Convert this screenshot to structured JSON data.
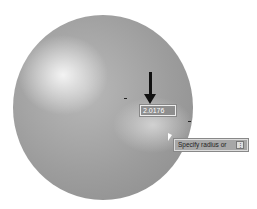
{
  "viewport": {
    "object": "sphere",
    "dynamic_input": {
      "value": "2.0176"
    },
    "tooltip": {
      "prompt": "Specify radius or",
      "options_button": "⋮"
    },
    "annotation": "arrow pointing to dynamic input field"
  }
}
